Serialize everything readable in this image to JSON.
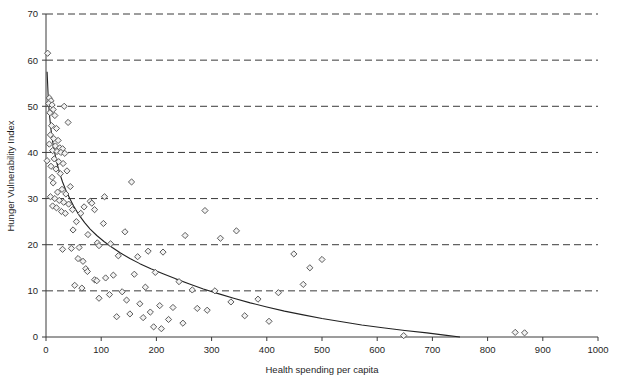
{
  "chart_data": {
    "type": "scatter",
    "title": "",
    "xlabel": "Health spending per capita",
    "ylabel": "Hunger Vulnerability Index",
    "xlim": [
      0,
      1000
    ],
    "ylim": [
      0,
      70
    ],
    "xticks": [
      0,
      100,
      200,
      300,
      400,
      500,
      600,
      700,
      800,
      900,
      1000
    ],
    "yticks": [
      0,
      10,
      20,
      30,
      40,
      50,
      60,
      70
    ],
    "grid": {
      "horizontal_dashed": true,
      "vertical": false,
      "color": "#3a3a3a"
    },
    "legend": {
      "visible": false
    },
    "marker": {
      "shape": "diamond",
      "size": 5,
      "fill": "#f2f2f2",
      "stroke": "#5a5a5a"
    },
    "trend": {
      "visible": true,
      "type": "power-decay",
      "color": "#222222",
      "description": "smooth decreasing curve from about 58 at x=2 down to 0 at x=750",
      "points": [
        [
          2,
          57.5
        ],
        [
          4,
          52.0
        ],
        [
          6,
          48.5
        ],
        [
          9,
          45.0
        ],
        [
          12,
          42.4
        ],
        [
          16,
          39.8
        ],
        [
          20,
          37.6
        ],
        [
          25,
          35.4
        ],
        [
          30,
          33.6
        ],
        [
          36,
          31.8
        ],
        [
          43,
          30.0
        ],
        [
          50,
          28.4
        ],
        [
          60,
          26.4
        ],
        [
          70,
          24.8
        ],
        [
          80,
          23.4
        ],
        [
          92,
          22.0
        ],
        [
          105,
          20.7
        ],
        [
          120,
          19.4
        ],
        [
          135,
          18.2
        ],
        [
          152,
          17.0
        ],
        [
          170,
          15.9
        ],
        [
          190,
          14.8
        ],
        [
          212,
          13.7
        ],
        [
          235,
          12.6
        ],
        [
          260,
          11.5
        ],
        [
          285,
          10.4
        ],
        [
          312,
          9.4
        ],
        [
          340,
          8.4
        ],
        [
          370,
          7.4
        ],
        [
          400,
          6.5
        ],
        [
          432,
          5.6
        ],
        [
          466,
          4.8
        ],
        [
          500,
          4.0
        ],
        [
          536,
          3.3
        ],
        [
          572,
          2.6
        ],
        [
          610,
          2.0
        ],
        [
          650,
          1.4
        ],
        [
          690,
          0.9
        ],
        [
          722,
          0.4
        ],
        [
          750,
          0.0
        ]
      ]
    },
    "points": [
      [
        3,
        61.5
      ],
      [
        6,
        51.8
      ],
      [
        9,
        51.2
      ],
      [
        5,
        50.6
      ],
      [
        11,
        50.3
      ],
      [
        33,
        50.0
      ],
      [
        13,
        49.3
      ],
      [
        7,
        48.6
      ],
      [
        16,
        48.0
      ],
      [
        40,
        46.5
      ],
      [
        10,
        45.8
      ],
      [
        19,
        45.2
      ],
      [
        8,
        43.8
      ],
      [
        14,
        43.0
      ],
      [
        22,
        42.6
      ],
      [
        6,
        41.8
      ],
      [
        17,
        41.4
      ],
      [
        25,
        41.0
      ],
      [
        30,
        40.8
      ],
      [
        12,
        40.4
      ],
      [
        20,
        40.2
      ],
      [
        27,
        40.0
      ],
      [
        34,
        39.8
      ],
      [
        2,
        38.2
      ],
      [
        15,
        38.6
      ],
      [
        23,
        38.0
      ],
      [
        31,
        37.6
      ],
      [
        9,
        37.0
      ],
      [
        18,
        36.4
      ],
      [
        38,
        36.0
      ],
      [
        26,
        35.4
      ],
      [
        11,
        34.6
      ],
      [
        13,
        33.4
      ],
      [
        44,
        32.6
      ],
      [
        29,
        32.0
      ],
      [
        21,
        31.4
      ],
      [
        36,
        31.0
      ],
      [
        8,
        30.4
      ],
      [
        16,
        30.0
      ],
      [
        24,
        29.6
      ],
      [
        32,
        29.2
      ],
      [
        41,
        28.8
      ],
      [
        12,
        28.4
      ],
      [
        19,
        28.0
      ],
      [
        48,
        27.6
      ],
      [
        28,
        27.2
      ],
      [
        35,
        26.8
      ],
      [
        155,
        33.6
      ],
      [
        106,
        30.4
      ],
      [
        80,
        29.4
      ],
      [
        83,
        29.0
      ],
      [
        69,
        28.2
      ],
      [
        88,
        27.6
      ],
      [
        288,
        27.4
      ],
      [
        63,
        26.8
      ],
      [
        55,
        25.0
      ],
      [
        104,
        24.6
      ],
      [
        49,
        23.2
      ],
      [
        345,
        23.0
      ],
      [
        143,
        22.8
      ],
      [
        76,
        22.2
      ],
      [
        252,
        22.0
      ],
      [
        316,
        21.4
      ],
      [
        93,
        20.4
      ],
      [
        117,
        20.2
      ],
      [
        96,
        19.8
      ],
      [
        60,
        19.4
      ],
      [
        46,
        19.2
      ],
      [
        30,
        19.0
      ],
      [
        185,
        18.6
      ],
      [
        212,
        18.4
      ],
      [
        449,
        18.0
      ],
      [
        131,
        17.6
      ],
      [
        166,
        17.4
      ],
      [
        58,
        17.0
      ],
      [
        67,
        16.4
      ],
      [
        500,
        16.8
      ],
      [
        478,
        15.0
      ],
      [
        72,
        14.8
      ],
      [
        75,
        14.2
      ],
      [
        198,
        14.0
      ],
      [
        160,
        13.6
      ],
      [
        122,
        13.4
      ],
      [
        108,
        12.8
      ],
      [
        88,
        12.4
      ],
      [
        92,
        12.2
      ],
      [
        241,
        12.0
      ],
      [
        466,
        11.4
      ],
      [
        52,
        11.2
      ],
      [
        180,
        10.8
      ],
      [
        65,
        10.6
      ],
      [
        265,
        10.2
      ],
      [
        306,
        10.0
      ],
      [
        138,
        9.8
      ],
      [
        421,
        9.6
      ],
      [
        115,
        9.2
      ],
      [
        96,
        8.4
      ],
      [
        384,
        8.2
      ],
      [
        146,
        8.0
      ],
      [
        335,
        7.6
      ],
      [
        170,
        7.2
      ],
      [
        206,
        6.8
      ],
      [
        230,
        6.4
      ],
      [
        274,
        6.2
      ],
      [
        292,
        5.8
      ],
      [
        189,
        5.4
      ],
      [
        152,
        5.0
      ],
      [
        360,
        4.6
      ],
      [
        128,
        4.4
      ],
      [
        176,
        4.2
      ],
      [
        222,
        3.8
      ],
      [
        404,
        3.4
      ],
      [
        248,
        3.0
      ],
      [
        195,
        2.2
      ],
      [
        209,
        1.8
      ],
      [
        648,
        0.3
      ],
      [
        850,
        1.0
      ],
      [
        867,
        0.9
      ]
    ]
  },
  "axis": {
    "x_label": "Health spending per capita",
    "y_label": "Hunger Vulnerability Index",
    "x_ticks": [
      "0",
      "100",
      "200",
      "300",
      "400",
      "500",
      "600",
      "700",
      "800",
      "900",
      "1000"
    ],
    "y_ticks": [
      "0",
      "10",
      "20",
      "30",
      "40",
      "50",
      "60",
      "70"
    ]
  }
}
